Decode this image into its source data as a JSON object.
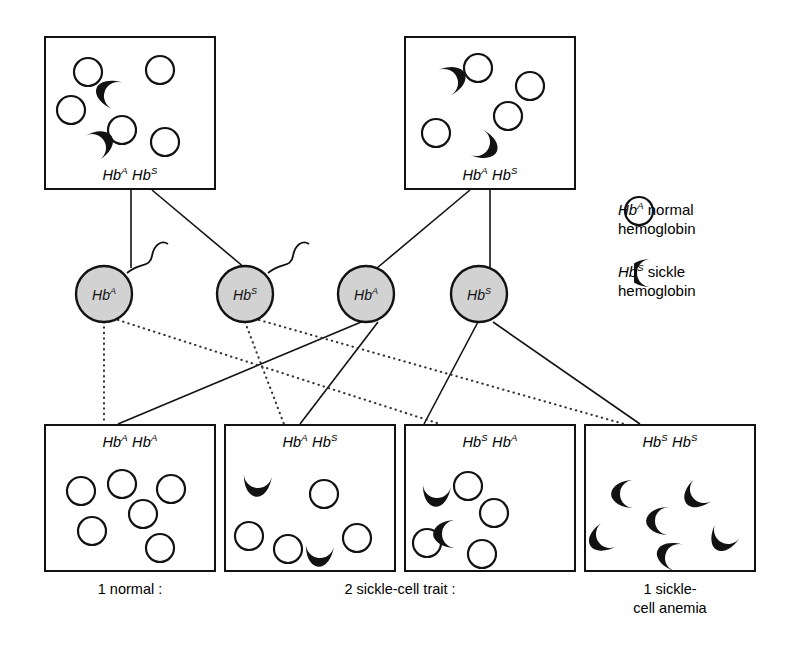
{
  "figure": {
    "background_color": "#ffffff",
    "ink_color": "#121212",
    "gamete_fill_color": "#d2d2d2"
  },
  "parents": [
    {
      "id": "parent-left",
      "genotype_plain": "Hb A Hb S",
      "allele1": "Hb",
      "allele1_sup": "A",
      "allele2": "Hb",
      "allele2_sup": "S",
      "normal_count": 5,
      "sickle_count": 2
    },
    {
      "id": "parent-right",
      "genotype_plain": "Hb A Hb S",
      "allele1": "Hb",
      "allele1_sup": "A",
      "allele2": "Hb",
      "allele2_sup": "S",
      "normal_count": 4,
      "sickle_count": 2
    }
  ],
  "gametes": [
    {
      "id": "gamete-sperm-a",
      "label": "Hb",
      "sup": "A",
      "type": "sperm",
      "from_parent": "parent-left"
    },
    {
      "id": "gamete-sperm-s",
      "label": "Hb",
      "sup": "S",
      "type": "sperm",
      "from_parent": "parent-left"
    },
    {
      "id": "gamete-egg-a",
      "label": "Hb",
      "sup": "A",
      "type": "egg",
      "from_parent": "parent-right"
    },
    {
      "id": "gamete-egg-s",
      "label": "Hb",
      "sup": "S",
      "type": "egg",
      "from_parent": "parent-right"
    }
  ],
  "offspring": [
    {
      "id": "offspring-1",
      "allele1": "Hb",
      "allele1_sup": "A",
      "allele2": "Hb",
      "allele2_sup": "A",
      "genotype_plain": "Hb A Hb A",
      "normal_count": 6,
      "sickle_count": 0,
      "caption": "1 normal :"
    },
    {
      "id": "offspring-2",
      "allele1": "Hb",
      "allele1_sup": "A",
      "allele2": "Hb",
      "allele2_sup": "S",
      "genotype_plain": "Hb A Hb S",
      "normal_count": 4,
      "sickle_count": 2,
      "caption": "2 sickle-cell trait :"
    },
    {
      "id": "offspring-3",
      "allele1": "Hb",
      "allele1_sup": "S",
      "allele2": "Hb",
      "allele2_sup": "A",
      "genotype_plain": "Hb S Hb A",
      "normal_count": 4,
      "sickle_count": 2,
      "caption": ""
    },
    {
      "id": "offspring-4",
      "allele1": "Hb",
      "allele1_sup": "S",
      "allele2": "Hb",
      "allele2_sup": "S",
      "genotype_plain": "Hb S Hb S",
      "normal_count": 0,
      "sickle_count": 6,
      "caption": "1 sickle-\ncell anemia"
    }
  ],
  "captions": {
    "normal": "1 normal :",
    "trait": "2 sickle-cell trait :",
    "anemia_line1": "1 sickle-",
    "anemia_line2": "cell anemia"
  },
  "legend": {
    "items": [
      {
        "id": "legend-normal",
        "allele": "Hb",
        "allele_sup": "A",
        "line1": "normal",
        "line2": "hemoglobin",
        "icon": "open-circle-icon",
        "full_text": "Hb A normal hemoglobin"
      },
      {
        "id": "legend-sickle",
        "allele": "Hb",
        "allele_sup": "S",
        "line1": "sickle",
        "line2": "hemoglobin",
        "icon": "crescent-icon",
        "full_text": "Hb S sickle hemoglobin"
      }
    ]
  }
}
